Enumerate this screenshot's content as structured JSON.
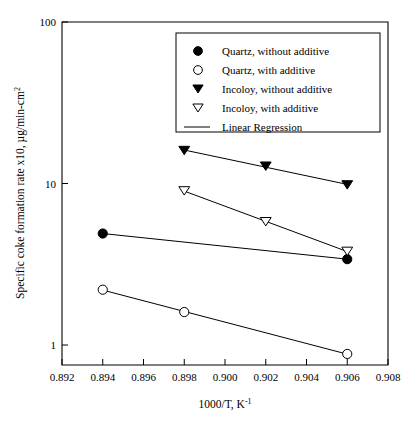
{
  "chart_data": {
    "type": "scatter",
    "title": "",
    "xlabel": "1000/T, K-1",
    "xlabel_base": "1000/T, K",
    "xlabel_exponent": "-1",
    "ylabel": "Specific coke formation rate x10, µg/min-cm2",
    "ylabel_base": "Specific coke formation rate x10, µg/min-cm",
    "ylabel_exponent": "2",
    "xlim": [
      0.892,
      0.908
    ],
    "ylim": [
      1,
      100
    ],
    "yscale": "log",
    "xticks": [
      "0.892",
      "0.894",
      "0.896",
      "0.898",
      "0.900",
      "0.902",
      "0.904",
      "0.906",
      "0.908"
    ],
    "xtick_values": [
      0.892,
      0.894,
      0.896,
      0.898,
      0.9,
      0.902,
      0.904,
      0.906,
      0.908
    ],
    "yticks": [
      "1",
      "10",
      "100"
    ],
    "ytick_values": [
      1,
      10,
      100
    ],
    "grid": false,
    "legend_position": "top-right",
    "series": [
      {
        "name": "Quartz, without additive",
        "marker": "filled-circle",
        "x": [
          0.894,
          0.906
        ],
        "values": [
          4.9,
          3.4
        ],
        "regression": true
      },
      {
        "name": "Quartz, with additive",
        "marker": "open-circle",
        "x": [
          0.894,
          0.898,
          0.906
        ],
        "values": [
          2.2,
          1.6,
          0.88
        ],
        "regression": true
      },
      {
        "name": "Incoloy, without additive",
        "marker": "filled-triangle-down",
        "x": [
          0.898,
          0.902,
          0.906
        ],
        "values": [
          16.0,
          12.8,
          9.8
        ],
        "regression": true
      },
      {
        "name": "Incoloy, with additive",
        "marker": "open-triangle-down",
        "x": [
          0.898,
          0.902,
          0.906
        ],
        "values": [
          9.0,
          5.8,
          3.8
        ],
        "regression": true
      }
    ],
    "legend_entries": [
      {
        "label": "Quartz, without additive",
        "marker": "filled-circle"
      },
      {
        "label": "Quartz, with additive",
        "marker": "open-circle"
      },
      {
        "label": "Incoloy, without additive",
        "marker": "filled-triangle-down"
      },
      {
        "label": "Incoloy, with additive",
        "marker": "open-triangle-down"
      },
      {
        "label": "Linear Regression",
        "marker": "line"
      }
    ]
  },
  "colors": {
    "ink": "#000000",
    "background": "#ffffff"
  }
}
